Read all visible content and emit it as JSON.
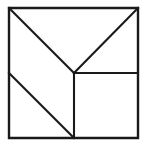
{
  "figure": {
    "background_color": "#ffffff",
    "line_color": "#1a1a1a",
    "fill_color": "#ffffff",
    "canvas": {
      "width": 146,
      "height": 147
    }
  },
  "geometry": {
    "square": {
      "label": "outer-square",
      "left": 9,
      "top": 8,
      "right": 138,
      "bottom": 138,
      "stroke_width": 2.4,
      "path": "M 9 8 L 138 8 L 138 138 L 9 138 Z"
    },
    "center_point": {
      "label": "center-vertex",
      "x": 74,
      "y": 73
    },
    "cuts": [
      {
        "name": "cut-top-left-diagonal",
        "from": {
          "x": 9,
          "y": 8
        },
        "to": {
          "x": 74,
          "y": 73
        },
        "path": "M 9 8 L 74 73"
      },
      {
        "name": "cut-top-right-diagonal",
        "from": {
          "x": 138,
          "y": 8
        },
        "to": {
          "x": 74,
          "y": 73
        },
        "path": "M 138 8 L 74 73"
      },
      {
        "name": "cut-center-horizontal",
        "from": {
          "x": 74,
          "y": 73
        },
        "to": {
          "x": 138,
          "y": 73
        },
        "path": "M 74 73 L 138 73"
      },
      {
        "name": "cut-center-vertical",
        "from": {
          "x": 74,
          "y": 73
        },
        "to": {
          "x": 74,
          "y": 138
        },
        "path": "M 74 73 L 74 138"
      },
      {
        "name": "cut-lower-left-diagonal",
        "from": {
          "x": 9,
          "y": 73
        },
        "to": {
          "x": 74,
          "y": 138
        },
        "path": "M 9 73 L 74 138"
      }
    ],
    "pieces": [
      {
        "name": "piece-large-triangle-upper-left",
        "shape": "triangle",
        "path": "M 9 8 L 74 73 L 9 73 Z"
      },
      {
        "name": "piece-large-triangle-top",
        "shape": "triangle",
        "path": "M 9 8 L 138 8 L 74 73 Z"
      },
      {
        "name": "piece-medium-triangle-right",
        "shape": "triangle",
        "path": "M 138 8 L 138 73 L 74 73 Z"
      },
      {
        "name": "piece-parallelogram-lower-left",
        "shape": "parallelogram",
        "path": "M 9 73 L 74 138 L 9 138 Z"
      },
      {
        "name": "piece-square-lower-right",
        "shape": "square",
        "path": "M 74 73 L 138 73 L 138 138 L 74 138 Z"
      }
    ]
  }
}
